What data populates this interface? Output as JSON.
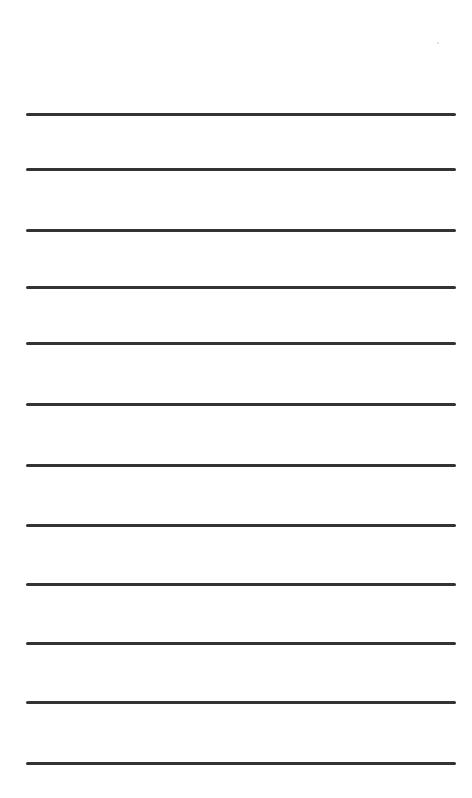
{
  "page": {
    "type": "lined-paper",
    "background": "#ffffff",
    "line_color": "#333333",
    "line_count": 12,
    "lines_y": [
      113,
      168,
      229,
      286,
      342,
      403,
      464,
      524,
      583,
      642,
      701,
      762
    ]
  }
}
